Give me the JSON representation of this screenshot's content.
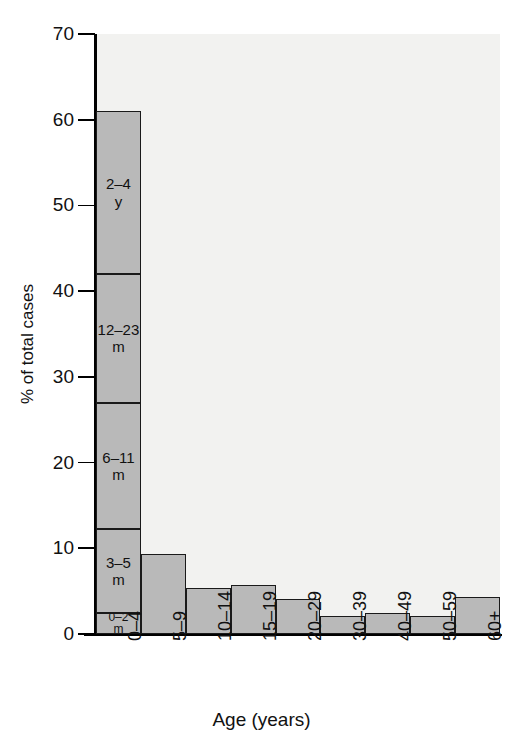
{
  "chart_data": {
    "type": "bar",
    "title": "",
    "xlabel": "Age (years)",
    "ylabel": "% of total cases",
    "ylim": [
      0,
      70
    ],
    "yticks": [
      0,
      10,
      20,
      30,
      40,
      50,
      60,
      70
    ],
    "grid": false,
    "legend": "none",
    "stacked_first_bar": true,
    "categories": [
      "0–4",
      "5–9",
      "10–14",
      "15–19",
      "20–29",
      "30–39",
      "40–49",
      "50–59",
      "60+"
    ],
    "values": [
      61.0,
      9.3,
      5.4,
      5.7,
      4.1,
      2.1,
      2.4,
      2.1,
      4.3
    ],
    "stack_segments": [
      {
        "label_line1": "0–2",
        "label_line2": "m",
        "value": 2.5,
        "bottom": 0.0,
        "top": 2.5
      },
      {
        "label_line1": "3–5",
        "label_line2": "m",
        "value": 9.7,
        "bottom": 2.5,
        "top": 12.2
      },
      {
        "label_line1": "6–11",
        "label_line2": "m",
        "value": 14.8,
        "bottom": 12.2,
        "top": 27.0
      },
      {
        "label_line1": "12–23",
        "label_line2": "m",
        "value": 15.0,
        "bottom": 27.0,
        "top": 42.0
      },
      {
        "label_line1": "2–4",
        "label_line2": "y",
        "value": 19.0,
        "bottom": 42.0,
        "top": 61.0
      }
    ],
    "colors": {
      "bar_fill": "#b9b9b9",
      "bar_stroke": "#1a1a1a",
      "plot_background": "#f2f2f0",
      "axis": "#000000",
      "text": "#111111"
    }
  },
  "axes": {
    "y_title": "% of total cases",
    "x_title": "Age (years)",
    "y_tick_labels": [
      "0",
      "10",
      "20",
      "30",
      "40",
      "50",
      "60",
      "70"
    ],
    "x_tick_labels": [
      "0–4",
      "5–9",
      "10–14",
      "15–19",
      "20–29",
      "30–39",
      "40–49",
      "50–59",
      "60+"
    ]
  },
  "caption": {
    "cropped_text": ""
  }
}
